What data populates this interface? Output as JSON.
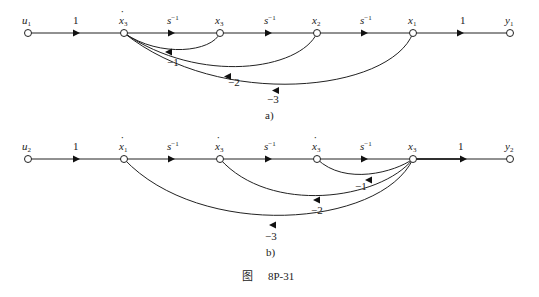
{
  "figure": {
    "caption_prefix": "图",
    "caption_number": "8P-31"
  },
  "diagram_a": {
    "sublabel": "a)",
    "nodes": [
      {
        "id": "u1",
        "label": "u",
        "sub": "1",
        "dot": false
      },
      {
        "id": "x3dot",
        "label": "x",
        "sub": "3",
        "dot": true
      },
      {
        "id": "x3",
        "label": "x",
        "sub": "3",
        "dot": false
      },
      {
        "id": "x2",
        "label": "x",
        "sub": "2",
        "dot": false
      },
      {
        "id": "x1",
        "label": "x",
        "sub": "1",
        "dot": false
      },
      {
        "id": "y1",
        "label": "y",
        "sub": "1",
        "dot": false
      }
    ],
    "forward_gains": [
      {
        "base": "1",
        "sup": ""
      },
      {
        "base": "s",
        "sup": "−1"
      },
      {
        "base": "s",
        "sup": "−1"
      },
      {
        "base": "s",
        "sup": "−1"
      },
      {
        "base": "1",
        "sup": ""
      }
    ],
    "feedback": [
      {
        "from": "x3",
        "to": "x3dot",
        "gain": "−1"
      },
      {
        "from": "x2",
        "to": "x3dot",
        "gain": "−2"
      },
      {
        "from": "x1",
        "to": "x3dot",
        "gain": "−3"
      }
    ]
  },
  "diagram_b": {
    "sublabel": "b)",
    "nodes": [
      {
        "id": "u2",
        "label": "u",
        "sub": "2",
        "dot": false
      },
      {
        "id": "x1dot",
        "label": "x",
        "sub": "1",
        "dot": true
      },
      {
        "id": "x2dot",
        "label": "x",
        "sub": "3",
        "dot": true
      },
      {
        "id": "x3dot",
        "label": "x",
        "sub": "3",
        "dot": true
      },
      {
        "id": "x3",
        "label": "x",
        "sub": "3",
        "dot": false
      },
      {
        "id": "y2",
        "label": "y",
        "sub": "2",
        "dot": false
      }
    ],
    "forward_gains": [
      {
        "base": "1",
        "sup": ""
      },
      {
        "base": "s",
        "sup": "−1"
      },
      {
        "base": "s",
        "sup": "−1"
      },
      {
        "base": "s",
        "sup": "−1"
      },
      {
        "base": "1",
        "sup": ""
      }
    ],
    "feedback": [
      {
        "from": "x3",
        "to": "x3dot",
        "gain": "−1"
      },
      {
        "from": "x3",
        "to": "x2dot",
        "gain": "−2"
      },
      {
        "from": "x3",
        "to": "x1dot",
        "gain": "−3"
      }
    ]
  }
}
